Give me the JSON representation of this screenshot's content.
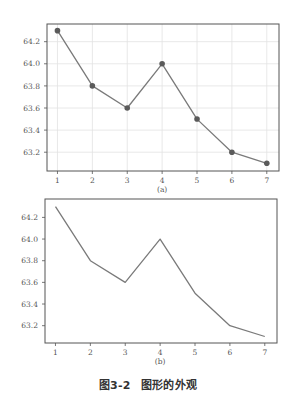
{
  "figure": {
    "caption_number": "图3-2",
    "caption_text": "图形的外观"
  },
  "colors": {
    "line": "#7a7a7a",
    "marker": "#5a5a5a",
    "frame": "#555555",
    "grid": "#e2e2e2",
    "text": "#555555"
  },
  "chart_data": [
    {
      "type": "line",
      "panel_label": "(a)",
      "x": [
        1,
        2,
        3,
        4,
        5,
        6,
        7
      ],
      "values": [
        64.3,
        63.8,
        63.6,
        64.0,
        63.5,
        63.2,
        63.1
      ],
      "markers": true,
      "grid": true,
      "title": "",
      "xlabel": "",
      "ylabel": "",
      "xticks": [
        "1",
        "2",
        "3",
        "4",
        "5",
        "6",
        "7"
      ],
      "yticks": [
        "63.2",
        "63.4",
        "63.6",
        "63.8",
        "64.0",
        "64.2"
      ],
      "ylim": [
        63.03,
        64.36
      ],
      "xlim": [
        0.7,
        7.35
      ],
      "box": {
        "left": 47,
        "top": 24,
        "right": 279,
        "bottom": 171
      }
    },
    {
      "type": "line",
      "panel_label": "(b)",
      "x": [
        1,
        2,
        3,
        4,
        5,
        6,
        7
      ],
      "values": [
        64.3,
        63.8,
        63.6,
        64.0,
        63.5,
        63.2,
        63.1
      ],
      "markers": false,
      "grid": false,
      "title": "",
      "xlabel": "",
      "ylabel": "",
      "xticks": [
        "1",
        "2",
        "3",
        "4",
        "5",
        "6",
        "7"
      ],
      "yticks": [
        "63.2",
        "63.4",
        "63.6",
        "63.8",
        "64.0",
        "64.2"
      ],
      "ylim": [
        63.04,
        64.37
      ],
      "xlim": [
        0.7,
        7.35
      ],
      "box": {
        "left": 45,
        "top": 199,
        "right": 277,
        "bottom": 343
      }
    }
  ]
}
